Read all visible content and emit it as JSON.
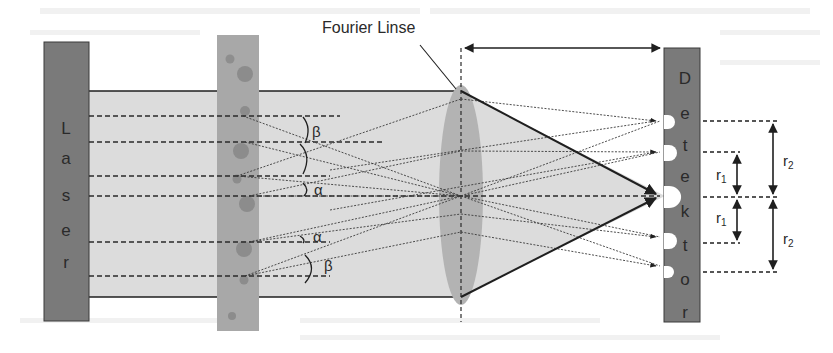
{
  "diagram": {
    "title_label": "Fourier Linse",
    "laser": {
      "label_letters": [
        "L",
        "a",
        "s",
        "e",
        "r"
      ],
      "color": "#7a7a7a"
    },
    "sample_cell": {
      "color": "#a8a8a8",
      "particle_color": "#8c8c8c"
    },
    "beam": {
      "color": "#dedede",
      "edge_color": "#1f1f1f"
    },
    "lens": {
      "color": "#b3b3b3"
    },
    "detector": {
      "label_letters": [
        "D",
        "e",
        "t",
        "e",
        "k",
        "t",
        "o",
        "r"
      ],
      "color": "#7a7a7a",
      "hole_color": "#ffffff"
    },
    "angle_labels": {
      "beta_top": "β",
      "alpha_top": "α",
      "alpha_bottom": "α",
      "beta_bottom": "β"
    },
    "radius_labels": {
      "r1_top": "r",
      "r1_top_sub": "1",
      "r1_bottom": "r",
      "r1_bottom_sub": "1",
      "r2_top": "r",
      "r2_top_sub": "2",
      "r2_bottom": "r",
      "r2_bottom_sub": "2"
    }
  }
}
